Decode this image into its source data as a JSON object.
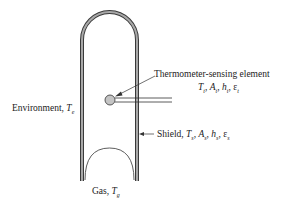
{
  "diagram": {
    "type": "thermometer-radiation-shield",
    "colors": {
      "shield_fill": "#9a9a9a",
      "shield_stroke": "#3a3a3a",
      "sensor_fill": "#bdbdbd",
      "line": "#333333",
      "text": "#222222"
    },
    "labels": {
      "sensor_title": "Thermometer-sensing element",
      "sensor_params": "T_t, A_t, h_t, ε_t",
      "environment": "Environment, T_e",
      "shield": "Shield, T_s, A_s, h_s, ε_s",
      "gas": "Gas, T_g"
    },
    "parts": {
      "sensor_params_text": {
        "t1": "T",
        "s1": "t",
        "t2": "A",
        "s2": "t",
        "t3": "h",
        "s3": "t",
        "t4": "ε",
        "s4": "t"
      },
      "environment_text": {
        "prefix": "Environment, ",
        "sym": "T",
        "sub": "e"
      },
      "shield_text": {
        "prefix": "Shield, ",
        "t1": "T",
        "s1": "s",
        "t2": "A",
        "s2": "s",
        "t3": "h",
        "s3": "s",
        "t4": "ε",
        "s4": "s"
      },
      "gas_text": {
        "prefix": "Gas, ",
        "sym": "T",
        "sub": "g"
      }
    }
  }
}
